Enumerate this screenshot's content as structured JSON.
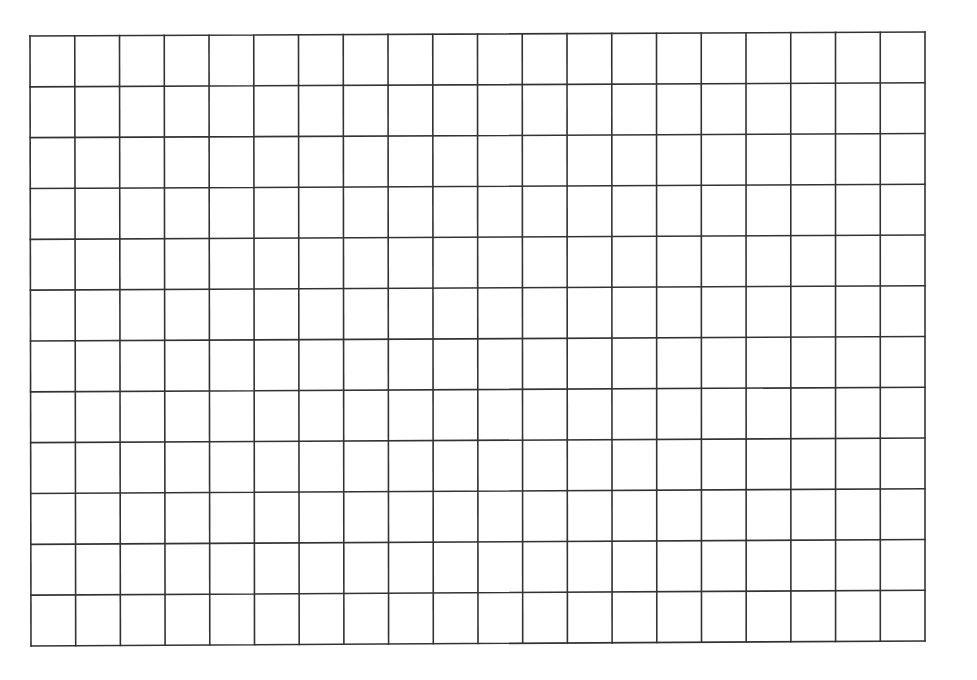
{
  "grid": {
    "columns": 20,
    "rows": 12,
    "corners": {
      "top_left": [
        30,
        36
      ],
      "top_right": [
        925,
        32
      ],
      "bottom_left": [
        31,
        646
      ],
      "bottom_right": [
        925,
        641
      ]
    },
    "line_color": "#333333",
    "line_width": 1.6,
    "background": "#ffffff"
  }
}
